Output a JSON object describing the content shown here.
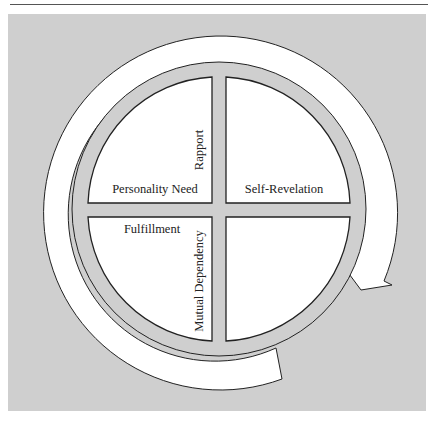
{
  "figure": {
    "colors": {
      "panel": "#cfcfcf",
      "ring": "#cfcfcf",
      "fill": "#ffffff",
      "stroke": "#222222"
    },
    "quadrants": {
      "top_left": {
        "label": "Personality Need",
        "side_label": "Rapport"
      },
      "top_right": {
        "label": "Self-Revelation"
      },
      "bottom_left": {
        "label": "Fulfillment",
        "side_label": "Mutual Dependency"
      },
      "bottom_right": {
        "label": ""
      }
    },
    "cycle_arrow": {
      "direction": "clockwise"
    }
  }
}
